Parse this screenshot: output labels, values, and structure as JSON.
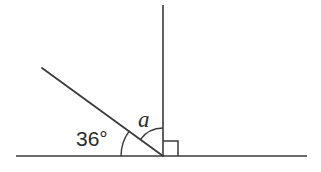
{
  "diagram": {
    "background_color": "#ffffff",
    "stroke_color": "#3a3a3a",
    "text_color": "#2b2b2b",
    "labels": {
      "known_angle": "36°",
      "unknown_angle": "a"
    },
    "geometry": {
      "vertex": {
        "x": 163,
        "y": 156
      },
      "baseline": {
        "name": "horizontal-line",
        "x1": 16,
        "y1": 156,
        "x2": 307,
        "y2": 156
      },
      "vertical_ray": {
        "name": "vertical-line",
        "x1": 163,
        "y1": 156,
        "x2": 163,
        "y2": 5
      },
      "slanted_ray": {
        "name": "slanted-line",
        "x1": 163,
        "y1": 156,
        "x2": 42,
        "y2": 68,
        "degrees_above_horizontal": 36
      },
      "arc_known_angle": {
        "name": "arc-36",
        "radius": 42,
        "start_degrees": 180,
        "end_degrees": 144
      },
      "arc_unknown_angle": {
        "name": "arc-a",
        "radius": 28,
        "start_degrees": 144,
        "end_degrees": 90
      },
      "right_angle_marker": {
        "name": "right-angle-square",
        "size": 15,
        "corner_x": 163,
        "corner_y": 156
      }
    }
  }
}
